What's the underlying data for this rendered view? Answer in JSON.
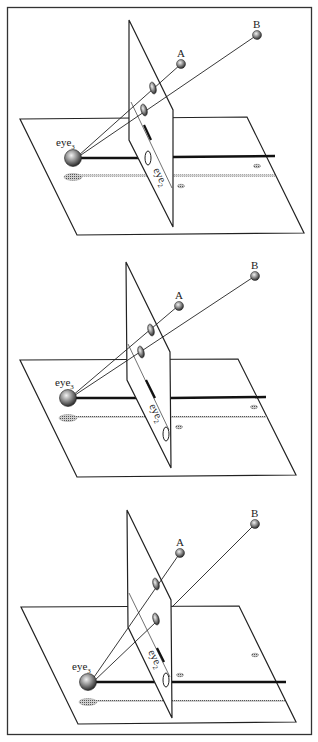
{
  "figure": {
    "frame_color": "#333333",
    "panels": [
      {
        "id": "panel-1",
        "labels": {
          "A": "A",
          "B": "B",
          "eye3": "eye",
          "eye3_sub": "3",
          "eye2": "eye",
          "eye2_sub": "2"
        }
      },
      {
        "id": "panel-2",
        "labels": {
          "A": "A",
          "B": "B",
          "eye3": "eye",
          "eye3_sub": "3",
          "eye2": "eye",
          "eye2_sub": "2"
        }
      },
      {
        "id": "panel-3",
        "labels": {
          "A": "A",
          "B": "B",
          "eye3": "eye",
          "eye3_sub": "3",
          "eye2": "eye",
          "eye2_sub": "2"
        }
      }
    ]
  }
}
